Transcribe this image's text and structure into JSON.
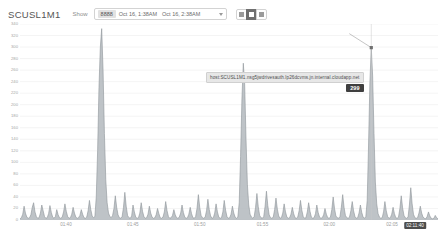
{
  "header": {
    "title": "SCUSL1M1",
    "show_label": "Show",
    "range_chip": "8888",
    "range_from": "Oct 16, 1:38AM",
    "range_to": "Oct 16, 2:38AM",
    "caret_icon": "chevron-down-icon",
    "view_buttons": [
      {
        "name": "view-list",
        "icon": "list-view-icon",
        "active": false
      },
      {
        "name": "view-grid",
        "icon": "grid-view-icon",
        "active": true
      },
      {
        "name": "view-chart",
        "icon": "chart-view-icon",
        "active": false
      }
    ]
  },
  "tooltip": {
    "series_name": "host:SCUSL1M1.nsg5jwdrivesauth.lp26dcvms.jn.internal.cloudapp.net",
    "value": "299"
  },
  "colors": {
    "series": "#9aa0a6",
    "grid": "#ededed",
    "axis_text": "#a6a6a6",
    "accent_dark": "#4c4c4c",
    "tooltip_bg": "#e7e7e7"
  },
  "chart_data": {
    "type": "area",
    "title": "SCUSL1M1",
    "xlabel": "",
    "ylabel": "",
    "grid": true,
    "legend": "none",
    "ylim": [
      0,
      340
    ],
    "yticks": [
      0,
      20,
      40,
      60,
      80,
      100,
      120,
      140,
      160,
      180,
      200,
      220,
      240,
      260,
      280,
      300,
      320,
      340
    ],
    "ytick_labels": [
      "0",
      "20",
      "40",
      "60",
      "80",
      "100",
      "120",
      "140",
      "160",
      "180",
      "200",
      "220",
      "240",
      "260",
      "280",
      "300",
      "320",
      "340"
    ],
    "xtick_labels": [
      "01:40",
      "01:45",
      "01:50",
      "01:55",
      "02:00",
      "02:05"
    ],
    "xtick_positions": [
      0.11,
      0.27,
      0.43,
      0.58,
      0.74,
      0.89
    ],
    "cursor_xlabel": "02:11:40",
    "cursor_x_position": 0.945,
    "hover_value": 299,
    "series": [
      {
        "name": "host:SCUSL1M1.nsg5jwdrivesauth.lp26dcvms.jn.internal.cloudapp.net",
        "color": "#9aa0a6",
        "values": [
          2,
          4,
          10,
          24,
          12,
          5,
          3,
          4,
          9,
          22,
          30,
          14,
          6,
          3,
          4,
          12,
          26,
          16,
          6,
          3,
          4,
          11,
          25,
          13,
          5,
          3,
          6,
          18,
          9,
          4,
          3,
          5,
          14,
          28,
          15,
          6,
          3,
          4,
          10,
          22,
          12,
          5,
          3,
          4,
          8,
          18,
          10,
          4,
          3,
          5,
          16,
          34,
          18,
          7,
          4,
          6,
          40,
          120,
          230,
          300,
          332,
          260,
          150,
          70,
          30,
          12,
          6,
          4,
          8,
          20,
          42,
          22,
          9,
          4,
          3,
          6,
          22,
          48,
          24,
          8,
          4,
          3,
          7,
          26,
          14,
          5,
          3,
          4,
          12,
          30,
          15,
          6,
          3,
          4,
          10,
          24,
          12,
          5,
          3,
          4,
          9,
          20,
          11,
          4,
          3,
          5,
          14,
          32,
          16,
          6,
          3,
          4,
          8,
          18,
          9,
          4,
          3,
          5,
          12,
          26,
          13,
          5,
          3,
          4,
          10,
          22,
          11,
          4,
          3,
          6,
          20,
          44,
          22,
          8,
          4,
          3,
          5,
          16,
          36,
          18,
          7,
          3,
          4,
          12,
          28,
          14,
          5,
          3,
          4,
          14,
          34,
          17,
          6,
          3,
          4,
          10,
          24,
          12,
          5,
          3,
          5,
          30,
          110,
          210,
          272,
          236,
          140,
          62,
          26,
          10,
          5,
          3,
          6,
          22,
          46,
          23,
          8,
          4,
          3,
          6,
          24,
          50,
          25,
          9,
          4,
          3,
          5,
          18,
          38,
          19,
          7,
          3,
          4,
          12,
          28,
          14,
          5,
          3,
          4,
          10,
          22,
          11,
          4,
          3,
          5,
          16,
          34,
          17,
          6,
          3,
          4,
          14,
          30,
          15,
          5,
          3,
          4,
          11,
          26,
          13,
          5,
          3,
          4,
          9,
          20,
          10,
          4,
          3,
          5,
          18,
          40,
          20,
          7,
          4,
          3,
          6,
          22,
          44,
          22,
          8,
          4,
          3,
          5,
          16,
          32,
          16,
          6,
          3,
          4,
          12,
          26,
          13,
          5,
          3,
          6,
          34,
          130,
          240,
          299,
          250,
          150,
          66,
          28,
          11,
          5,
          3,
          4,
          14,
          32,
          16,
          6,
          3,
          4,
          10,
          22,
          11,
          4,
          3,
          5,
          20,
          42,
          21,
          8,
          4,
          3,
          5,
          26,
          56,
          28,
          10,
          4,
          3,
          4,
          12,
          24,
          12,
          5,
          3,
          2,
          6,
          14,
          7,
          3,
          2,
          3,
          8,
          4,
          2
        ]
      }
    ]
  }
}
